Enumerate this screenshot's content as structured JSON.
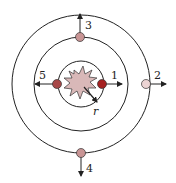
{
  "diagram": {
    "center": {
      "x": 81,
      "y": 84
    },
    "circles": [
      {
        "name": "inner",
        "r": 23
      },
      {
        "name": "middle",
        "r": 47
      },
      {
        "name": "outer",
        "r": 69
      }
    ],
    "nucleus": {
      "shape": "starburst",
      "fill": "#d9b8b8"
    },
    "radius_label": "r",
    "particles": [
      {
        "id": "1",
        "label": "1",
        "fill": "#a52020",
        "direction": "right"
      },
      {
        "id": "2",
        "label": "2",
        "fill": "#ecd4d4",
        "direction": "right"
      },
      {
        "id": "3",
        "label": "3",
        "fill": "#c99595",
        "direction": "up"
      },
      {
        "id": "4",
        "label": "4",
        "fill": "#c99595",
        "direction": "down"
      },
      {
        "id": "5",
        "label": "5",
        "fill": "#a84848",
        "direction": "left"
      }
    ],
    "colors": {
      "stroke": "#222222"
    }
  }
}
